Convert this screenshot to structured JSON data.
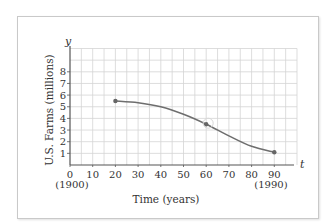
{
  "chart_data": {
    "type": "line",
    "title": "",
    "xlabel": "Time (years)",
    "ylabel": "U.S. Farms (millions)",
    "x_axis_symbol": "t",
    "y_axis_symbol": "y",
    "x_ticks": [
      0,
      10,
      20,
      30,
      40,
      50,
      60,
      70,
      80,
      90
    ],
    "x_tick_sublabels": {
      "0": "(1900)",
      "90": "(1990)"
    },
    "y_ticks": [
      1,
      2,
      3,
      4,
      5,
      6,
      7,
      8
    ],
    "xlim": [
      0,
      100
    ],
    "ylim": [
      0,
      10
    ],
    "grid": true,
    "legend": null,
    "series": [
      {
        "name": "U.S. Farms",
        "color": "#6e6e6e",
        "x": [
          20,
          30,
          40,
          50,
          60,
          70,
          80,
          90
        ],
        "values": [
          5.5,
          5.35,
          5.0,
          4.35,
          3.5,
          2.5,
          1.6,
          1.1
        ],
        "marked_points": [
          {
            "x": 20,
            "y": 5.5
          },
          {
            "x": 60,
            "y": 3.5
          },
          {
            "x": 90,
            "y": 1.1
          }
        ],
        "annotations": [
          {
            "type": "open-circle",
            "x": 60,
            "y": 3.5
          }
        ]
      }
    ]
  },
  "labels": {
    "x_title": "Time (years)",
    "y_title": "U.S. Farms (millions)",
    "t_symbol": "t",
    "y_symbol": "y",
    "x_ticks": [
      "0",
      "10",
      "20",
      "30",
      "40",
      "50",
      "60",
      "70",
      "80",
      "90"
    ],
    "y_ticks": [
      "1",
      "2",
      "3",
      "4",
      "5",
      "6",
      "7",
      "8"
    ],
    "x_sub_0": "(1900)",
    "x_sub_90": "(1990)"
  },
  "colors": {
    "grid": "#d4d4d4",
    "axis": "#555555",
    "curve": "#6e6e6e",
    "frame": "#c9c9c9"
  }
}
